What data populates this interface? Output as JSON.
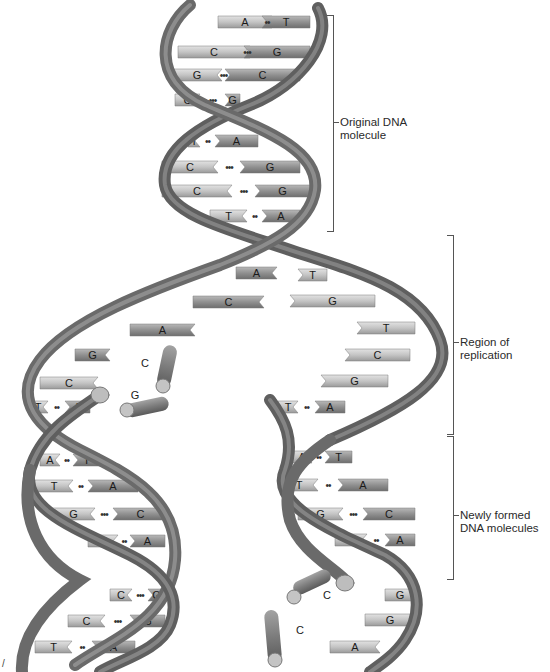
{
  "colors": {
    "backbone": "#7a7a7a",
    "backbone_dark": "#555555",
    "backbone_light": "#a8a8a8",
    "base_light": "#c9c9c9",
    "base_dark": "#8e8e8e",
    "text": "#1a1a1a",
    "bracket": "#555555"
  },
  "labels": {
    "original": {
      "line1": "Original DNA",
      "line2": "molecule"
    },
    "replication": {
      "line1": "Region of",
      "line2": "replication"
    },
    "newly_formed": {
      "line1": "Newly formed",
      "line2": "DNA molecules"
    }
  },
  "corner_mark": "/",
  "original_pairs": [
    {
      "left": "A",
      "right": "T",
      "bonds": "••",
      "y": 22,
      "x1": 218,
      "x2": 272,
      "xr1": 262,
      "xr2": 310
    },
    {
      "left": "C",
      "right": "G",
      "bonds": "•••",
      "y": 52,
      "x1": 178,
      "x2": 250,
      "xr1": 244,
      "xr2": 310
    },
    {
      "left": "G",
      "right": "C",
      "bonds": "•••",
      "y": 75,
      "x1": 172,
      "x2": 222,
      "xr1": 225,
      "xr2": 300
    },
    {
      "left": "C",
      "right": "G",
      "bonds": "•••",
      "y": 100,
      "x1": 175,
      "x2": 200,
      "xr1": 225,
      "xr2": 240
    },
    {
      "left": "T",
      "right": "A",
      "bonds": "••",
      "y": 141,
      "x1": 188,
      "x2": 200,
      "xr1": 215,
      "xr2": 258
    },
    {
      "left": "C",
      "right": "G",
      "bonds": "•••",
      "y": 167,
      "x1": 162,
      "x2": 218,
      "xr1": 240,
      "xr2": 300
    },
    {
      "left": "C",
      "right": "G",
      "bonds": "•••",
      "y": 191,
      "x1": 162,
      "x2": 232,
      "xr1": 255,
      "xr2": 310
    },
    {
      "left": "T",
      "right": "A",
      "bonds": "••",
      "y": 216,
      "x1": 210,
      "x2": 247,
      "xr1": 262,
      "xr2": 300
    }
  ],
  "replication_left": [
    {
      "base": "A",
      "y": 273,
      "x1": 236,
      "x2": 277
    },
    {
      "base": "C",
      "y": 302,
      "x1": 193,
      "x2": 264
    },
    {
      "base": "A",
      "y": 330,
      "x1": 130,
      "x2": 195
    },
    {
      "base": "G",
      "y": 355,
      "x1": 75,
      "x2": 110
    }
  ],
  "replication_right": [
    {
      "base": "T",
      "y": 275,
      "x1": 298,
      "x2": 327
    },
    {
      "base": "G",
      "y": 301,
      "x1": 290,
      "x2": 375
    },
    {
      "base": "T",
      "y": 328,
      "x1": 357,
      "x2": 415
    },
    {
      "base": "C",
      "y": 355,
      "x1": 345,
      "x2": 410
    },
    {
      "base": "G",
      "y": 381,
      "x1": 321,
      "x2": 388
    }
  ],
  "free_nucleotides": [
    {
      "base": "C",
      "x": 145,
      "y": 363
    },
    {
      "base": "G",
      "x": 135,
      "y": 395
    },
    {
      "base": "C",
      "x": 327,
      "y": 595
    },
    {
      "base": "C",
      "x": 300,
      "y": 630
    }
  ],
  "left_daughter_pairs": [
    {
      "left": "C",
      "y": 383,
      "x1": 40,
      "x2": 98,
      "single": true
    },
    {
      "left": "T",
      "right": "A",
      "bonds": "••",
      "y": 407,
      "x1": 28,
      "x2": 48,
      "xr1": 65,
      "xr2": 90
    },
    {
      "left": "A",
      "right": "T",
      "bonds": "••",
      "y": 460,
      "x1": 40,
      "x2": 60,
      "xr1": 73,
      "xr2": 100
    },
    {
      "left": "T",
      "right": "A",
      "bonds": "••",
      "y": 486,
      "x1": 35,
      "x2": 73,
      "xr1": 88,
      "xr2": 138
    },
    {
      "left": "G",
      "right": "C",
      "bonds": "•••",
      "y": 514,
      "x1": 52,
      "x2": 95,
      "xr1": 113,
      "xr2": 168
    },
    {
      "left": "T",
      "right": "A",
      "bonds": "••",
      "y": 541,
      "x1": 88,
      "x2": 118,
      "xr1": 130,
      "xr2": 165
    },
    {
      "left": "C",
      "right": "G",
      "bonds": "•••",
      "y": 595,
      "x1": 110,
      "x2": 132,
      "xr1": 148,
      "xr2": 165
    },
    {
      "left": "C",
      "right": "G",
      "bonds": "•••",
      "y": 621,
      "x1": 68,
      "x2": 105,
      "xr1": 130,
      "xr2": 165
    },
    {
      "left": "T",
      "right": "A",
      "bonds": "••",
      "y": 647,
      "x1": 35,
      "x2": 72,
      "xr1": 92,
      "xr2": 135
    }
  ],
  "right_daughter_pairs": [
    {
      "left": "T",
      "right": "A",
      "bonds": "••",
      "y": 407,
      "x1": 278,
      "x2": 298,
      "xr1": 315,
      "xr2": 345
    },
    {
      "left": "A",
      "right": "T",
      "bonds": "••",
      "y": 457,
      "x1": 292,
      "x2": 312,
      "xr1": 325,
      "xr2": 352
    },
    {
      "left": "T",
      "right": "A",
      "bonds": "••",
      "y": 485,
      "x1": 280,
      "x2": 318,
      "xr1": 338,
      "xr2": 388
    },
    {
      "left": "G",
      "right": "C",
      "bonds": "•••",
      "y": 514,
      "x1": 298,
      "x2": 343,
      "xr1": 363,
      "xr2": 415
    },
    {
      "left": "T",
      "right": "A",
      "bonds": "••",
      "y": 540,
      "x1": 335,
      "x2": 367,
      "xr1": 385,
      "xr2": 415
    },
    {
      "left": "G",
      "y": 595,
      "x1": 385,
      "x2": 415,
      "single": true
    },
    {
      "left": "G",
      "y": 620,
      "x1": 365,
      "x2": 415,
      "single": true
    },
    {
      "left": "A",
      "y": 647,
      "x1": 330,
      "x2": 380,
      "single": true
    }
  ]
}
